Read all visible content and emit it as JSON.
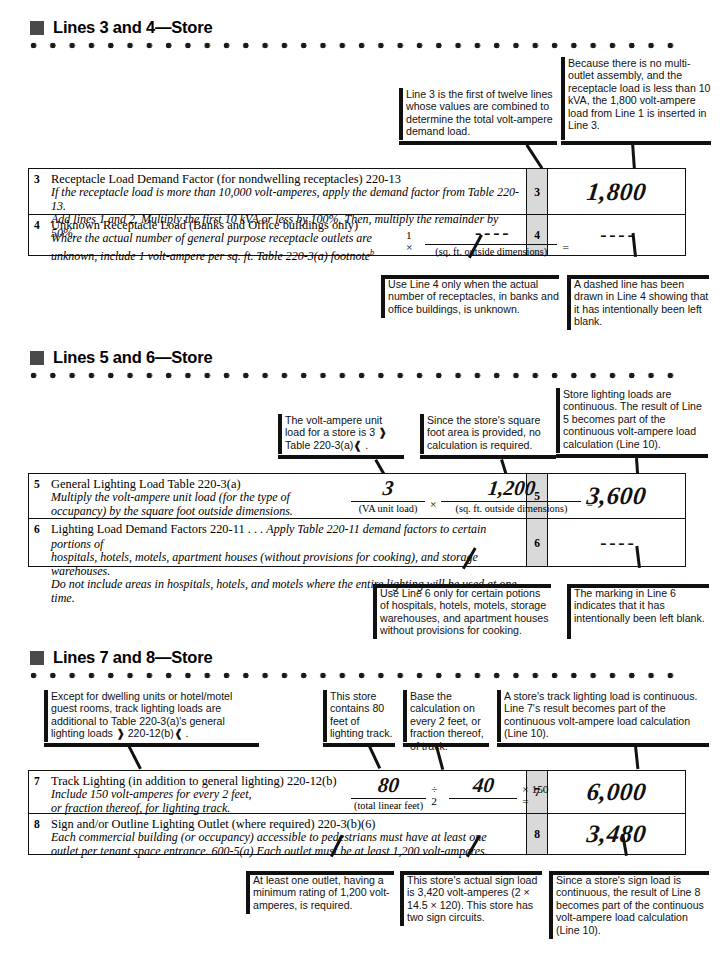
{
  "sections": [
    {
      "id": "lines-3-4",
      "heading": "Lines 3 and 4—Store",
      "callouts_top": [
        {
          "id": "c1",
          "text": "Line 3 is the first of twelve lines whose values are combined to determine the total volt-ampere demand load."
        },
        {
          "id": "c2",
          "text": "Because there is no multi-outlet assembly, and the receptacle load is less than 10 kVA, the 1,800 volt-ampere load from Line 1 is inserted in Line 3."
        }
      ],
      "rows": [
        {
          "num": "3",
          "title": "Receptacle Load Demand Factor (for nondwelling receptacles)  220-13",
          "italics": [
            "If the receptacle load is more than 10,000 volt-amperes, apply the demand factor from Table 220-13.",
            "Add lines 1 and 2. Multiply the first 10 kVA or less by 100%. Then, multiply the remainder by 50%."
          ],
          "index": "3",
          "value": "1,800",
          "value_kind": "hand"
        },
        {
          "num": "4",
          "title": "Unknown Receptacle Load  (Banks and Office buildings only)",
          "italics": [
            "Where the actual number of general purpose receptacle outlets are",
            "unknown, include 1 volt-ampere per sq. ft. Table 220-3(a) footnote"
          ],
          "footnote_sup": "b",
          "formula": {
            "lead": "1 ×",
            "numerator": "- - - -",
            "denominator": "(sq. ft. outside dimensions)",
            "tail": "="
          },
          "index": "4",
          "value": "- - - -",
          "value_kind": "dash"
        }
      ],
      "callouts_bottom": [
        {
          "id": "c3",
          "text": "Use Line 4 only when the actual number of receptacles, in banks and office buildings, is unknown."
        },
        {
          "id": "c4",
          "text": "A dashed line has been drawn in Line 4 showing that it has intentionally been left blank."
        }
      ]
    },
    {
      "id": "lines-5-6",
      "heading": "Lines 5 and 6—Store",
      "callouts_top": [
        {
          "id": "c5",
          "text": "The volt-ampere unit load for a store is 3 ❱ Table 220-3(a)❰ ."
        },
        {
          "id": "c6",
          "text": "Since the store's square foot area is provided, no calculation is required."
        },
        {
          "id": "c7",
          "text": "Store lighting loads are continuous. The result of Line 5 becomes part of the continuous volt-ampere load calculation (Line 10)."
        }
      ],
      "rows": [
        {
          "num": "5",
          "title": "General Lighting Load  Table 220-3(a)",
          "italics": [
            "Multiply the volt-ampere unit load (for the type of",
            "occupancy) by the square foot outside dimensions."
          ],
          "formula2": {
            "n1": "3",
            "d1": "(VA unit load)",
            "op": "×",
            "n2": "1,200",
            "d2": "(sq. ft. outside dimensions)",
            "tail": "="
          },
          "index": "5",
          "value": "3,600",
          "value_kind": "hand"
        },
        {
          "num": "6",
          "title": "Lighting Load Demand Factors  220-11 . . .",
          "title_italic_tail": "Apply Table 220-11 demand factors to certain portions of",
          "italics": [
            "hospitals, hotels, motels, apartment houses (without provisions for cooking), and storage warehouses.",
            "Do not include areas in hospitals, hotels, and motels where the entire lighting will be used at one time."
          ],
          "index": "6",
          "value": "- - - -",
          "value_kind": "dash"
        }
      ],
      "callouts_bottom": [
        {
          "id": "c8",
          "text": "Use Line 6 only for certain potions of hospitals, hotels, motels, storage warehouses, and apartment houses without provisions for cooking."
        },
        {
          "id": "c9",
          "text": "The marking in Line 6 indicates that it has intentionally been left blank."
        }
      ]
    },
    {
      "id": "lines-7-8",
      "heading": "Lines 7 and 8—Store",
      "callouts_top": [
        {
          "id": "c10",
          "text": "Except for dwelling units or hotel/motel guest rooms, track lighting loads are additional to Table 220-3(a)'s general lighting loads ❱ 220-12(b)❰ ."
        },
        {
          "id": "c11",
          "text": "This store contains 80 feet of lighting track."
        },
        {
          "id": "c12",
          "text": "Base the calculation on every 2 feet, or fraction thereof, of track."
        },
        {
          "id": "c13",
          "text": "A store's track lighting load is continuous. Line 7's result becomes part of the continuous volt-ampere load calculation (Line 10)."
        }
      ],
      "rows": [
        {
          "num": "7",
          "title": "Track Lighting (in addition to general lighting)  220-12(b)",
          "italics": [
            "Include 150 volt-amperes for every 2 feet,",
            "or fraction thereof, for lighting track."
          ],
          "formula3": {
            "n1": "80",
            "d1": "(total linear feet)",
            "op": "÷ 2",
            "n2": "40",
            "tail": "× 150 ="
          },
          "index": "7",
          "value": "6,000",
          "value_kind": "hand"
        },
        {
          "num": "8",
          "title": "Sign and/or Outline Lighting Outlet (where required)  220-3(b)(6)",
          "italics": [
            "Each commercial building (or occupancy) accessible to pedestrians must have at least one",
            "outlet per tenant space entrance. 600-5(a) Each outlet must be at least 1,200 volt-amperes."
          ],
          "index": "8",
          "value": "3,480",
          "value_kind": "hand"
        }
      ],
      "callouts_bottom": [
        {
          "id": "c14",
          "text": "At least one outlet, having a minimum rating of 1,200 volt-amperes, is required."
        },
        {
          "id": "c15",
          "text": "This store's actual sign load is 3,420 volt-amperes (2 × 14.5 × 120). This store has two sign circuits."
        },
        {
          "id": "c16",
          "text": "Since a store's sign load is continuous, the result of Line 8 becomes part of the continuous volt-ampere load calculation (Line 10)."
        }
      ]
    }
  ],
  "colors": {
    "header_square": "#4a4a4a",
    "index_cell": "#d9d9d9",
    "ink": "#111111"
  }
}
